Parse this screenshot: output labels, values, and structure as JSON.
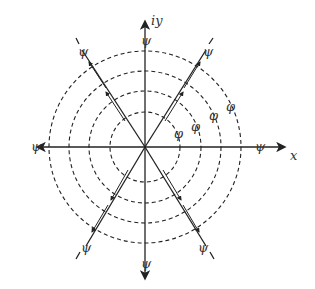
{
  "diagram": {
    "center": [
      145,
      147
    ],
    "circle_radii": [
      35,
      56,
      76,
      96
    ],
    "labels": {
      "x_axis": "x",
      "y_axis": "iy",
      "psi": "ψ",
      "phi": "φ"
    },
    "line_angles_deg": [
      0,
      60,
      90,
      120
    ],
    "colors": {
      "stroke": "#222222",
      "background": "#ffffff"
    }
  }
}
